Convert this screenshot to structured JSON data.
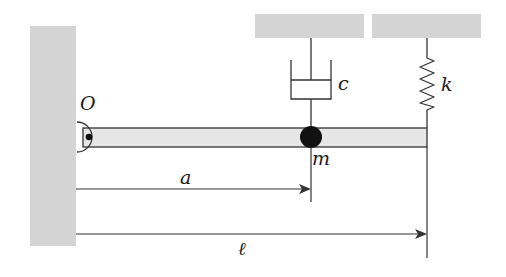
{
  "diagram": {
    "colors": {
      "ground_fill": "#d4d4d4",
      "beam_fill": "#e6e6e6",
      "stroke": "#333333",
      "mass": "#111111",
      "background": "#ffffff"
    },
    "labels": {
      "pivot": "O",
      "damper": "c",
      "spring": "k",
      "mass": "m",
      "dim_a": "a",
      "dim_l": "ℓ"
    },
    "components": [
      {
        "id": "wall",
        "type": "fixed-support",
        "position": "left"
      },
      {
        "id": "ceiling-damper",
        "type": "fixed-support",
        "position": "top"
      },
      {
        "id": "ceiling-spring",
        "type": "fixed-support",
        "position": "top-right"
      },
      {
        "id": "beam",
        "type": "rigid-bar",
        "pivot": "O"
      },
      {
        "id": "damper",
        "type": "dashpot",
        "label": "c",
        "attached_at": "a"
      },
      {
        "id": "spring",
        "type": "spring",
        "label": "k",
        "attached_at": "ℓ"
      },
      {
        "id": "mass",
        "type": "point-mass",
        "label": "m",
        "attached_at": "a"
      }
    ],
    "dimensions": [
      {
        "label": "a",
        "from": "O",
        "to": "mass"
      },
      {
        "label": "ℓ",
        "from": "O",
        "to": "beam end"
      }
    ]
  }
}
